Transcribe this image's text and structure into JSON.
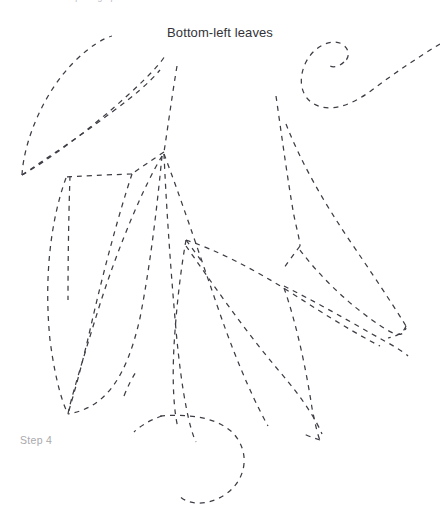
{
  "canvas": {
    "width": 440,
    "height": 520,
    "background": "#ffffff"
  },
  "caption_top": {
    "text": "trace over the photograph",
    "color": "#b9b9bd",
    "clipped": true
  },
  "title": {
    "text": "Bottom-left leaves",
    "color": "#333338"
  },
  "step": {
    "text": "Step 4",
    "color": "#a9a9ae"
  },
  "drawing": {
    "style": {
      "stroke": "#3d3d45",
      "stroke_width": 1.25,
      "dash_on": 5,
      "dash_off": 5,
      "fill": "none"
    },
    "subject": "leaf cluster outline tracing",
    "strokes": [
      {
        "name": "upper-left-leaf-outer-edge",
        "d": "M 22 175 C 24 140 44 92 74 62 C 90 46 104 38 112 36"
      },
      {
        "name": "upper-left-leaf-inner-edge",
        "d": "M 22 175 C 44 160 82 135 112 112 C 134 96 150 82 160 70"
      },
      {
        "name": "upper-left-leaf-midrib",
        "d": "M 22 175 C 52 158 95 125 128 95 C 150 75 162 62 166 54"
      },
      {
        "name": "central-stem-main",
        "d": "M 177 66 C 172 96 168 126 164 152"
      },
      {
        "name": "stem-node-to-left-branch",
        "d": "M 164 152 C 152 160 140 168 132 174"
      },
      {
        "name": "left-branch-upper-arc",
        "d": "M 132 174 C 104 175 80 176 66 177"
      },
      {
        "name": "left-leaf-upper-spine",
        "d": "M 70 176 C 69 205 68 250 68 300"
      },
      {
        "name": "left-leaf-outer-contour",
        "d": "M 66 178 C 50 222 44 280 50 340 C 56 386 64 406 68 414"
      },
      {
        "name": "left-leaf-inner-contour",
        "d": "M 132 174 C 120 210 104 268 90 330 C 78 382 70 406 68 414"
      },
      {
        "name": "second-leaf-outer-edge",
        "d": "M 162 156 C 144 186 120 242 100 304 C 82 362 70 402 68 414"
      },
      {
        "name": "second-leaf-inner-edge",
        "d": "M 162 156 C 158 196 152 256 140 318 C 126 380 104 408 68 414"
      },
      {
        "name": "second-leaf-vein-fork",
        "d": "M 124 396 C 128 386 132 378 136 372"
      },
      {
        "name": "central-leaf-left-edge",
        "d": "M 164 154 C 166 200 170 262 176 330 C 182 396 190 430 196 442"
      },
      {
        "name": "central-leaf-right-edge",
        "d": "M 164 154 C 180 196 198 250 218 308 C 240 372 258 408 268 426"
      },
      {
        "name": "middle-leaf-mid-node",
        "d": "M 186 240 C 192 248 198 256 202 262"
      },
      {
        "name": "middle-leaf-lower-left-vein",
        "d": "M 186 240 C 180 274 176 312 174 346 C 172 384 174 412 178 428"
      },
      {
        "name": "right-inner-leaf-upper-edge",
        "d": "M 186 240 C 216 250 252 268 290 292 C 330 318 360 336 380 346"
      },
      {
        "name": "right-inner-leaf-lower-edge",
        "d": "M 186 246 C 210 280 244 330 280 372 C 304 400 316 420 322 434"
      },
      {
        "name": "right-leaf-upper-rib",
        "d": "M 276 96 C 282 138 288 182 294 216 C 298 234 300 242 300 246"
      },
      {
        "name": "right-leaf-outer-arc",
        "d": "M 286 124 C 300 160 322 200 352 244 C 382 288 400 316 406 326"
      },
      {
        "name": "right-leaf-tip-join",
        "d": "M 406 326 C 404 332 398 336 388 338"
      },
      {
        "name": "right-leaf-lower-arc",
        "d": "M 300 250 C 318 274 344 300 372 320 C 392 334 402 340 406 328"
      },
      {
        "name": "right-leaf-base-fold",
        "d": "M 300 246 C 294 254 288 262 284 268"
      },
      {
        "name": "right-lower-leaf-top",
        "d": "M 284 286 C 312 300 344 318 372 334 C 394 346 404 352 408 356"
      },
      {
        "name": "right-lower-leaf-bottom",
        "d": "M 284 288 C 296 322 306 368 312 408 C 316 428 318 436 320 440"
      },
      {
        "name": "bottom-right-node",
        "d": "M 320 440 C 314 438 308 436 304 434"
      },
      {
        "name": "tendril-bottom-curl",
        "d": "M 160 416 C 186 414 214 416 232 432 C 250 450 248 478 226 494 C 206 508 184 504 178 494"
      },
      {
        "name": "tendril-bottom-left-stem",
        "d": "M 162 416 C 150 420 140 426 134 432"
      },
      {
        "name": "tendril-top-right-spiral-outer",
        "d": "M 440 44 C 420 56 396 72 372 90 C 348 108 328 112 314 104 C 300 96 298 78 306 62 C 314 46 332 38 342 44 C 350 49 350 58 344 62"
      },
      {
        "name": "tendril-top-right-inner-hook",
        "d": "M 344 62 C 340 66 334 68 330 66"
      }
    ]
  }
}
